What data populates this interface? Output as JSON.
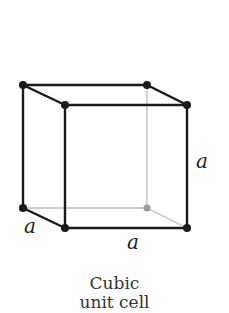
{
  "diagram": {
    "caption_line1": "Cubic",
    "caption_line2": "unit cell",
    "labels": {
      "edge_depth": "a",
      "edge_width": "a",
      "edge_height": "a"
    },
    "colors": {
      "front_edges": "#1a1a1a",
      "hidden_edges": "#b8b8b8",
      "hidden_vertex": "#9a9a9a"
    },
    "vertices": [
      {
        "id": "top-back-left",
        "x": 23,
        "y": 85,
        "hidden": false
      },
      {
        "id": "top-back-right",
        "x": 147,
        "y": 85,
        "hidden": false
      },
      {
        "id": "top-front-left",
        "x": 65,
        "y": 105,
        "hidden": false
      },
      {
        "id": "top-front-right",
        "x": 187,
        "y": 105,
        "hidden": false
      },
      {
        "id": "bottom-back-left",
        "x": 23,
        "y": 208,
        "hidden": false
      },
      {
        "id": "bottom-back-right",
        "x": 147,
        "y": 208,
        "hidden": true
      },
      {
        "id": "bottom-front-left",
        "x": 65,
        "y": 228,
        "hidden": false
      },
      {
        "id": "bottom-front-right",
        "x": 187,
        "y": 228,
        "hidden": false
      }
    ]
  }
}
